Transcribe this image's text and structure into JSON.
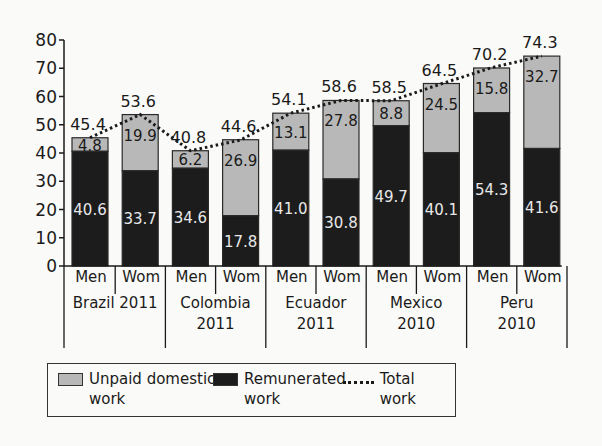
{
  "chart_data": {
    "type": "bar",
    "stacked": true,
    "title": "",
    "xlabel": "",
    "ylabel": "",
    "ylim": [
      0,
      80
    ],
    "yticks": [
      0,
      10,
      20,
      30,
      40,
      50,
      60,
      70,
      80
    ],
    "grid": false,
    "legend_position": "bottom",
    "groups": [
      {
        "label_line1": "Brazil 2011",
        "label_line2": ""
      },
      {
        "label_line1": "Colombia",
        "label_line2": "2011"
      },
      {
        "label_line1": "Ecuador",
        "label_line2": "2011"
      },
      {
        "label_line1": "Mexico",
        "label_line2": "2010"
      },
      {
        "label_line1": "Peru",
        "label_line2": "2010"
      }
    ],
    "categories": [
      "Men",
      "Wom",
      "Men",
      "Wom",
      "Men",
      "Wom",
      "Men",
      "Wom",
      "Men",
      "Wom"
    ],
    "series": [
      {
        "name": "Remunerated work",
        "color": "#1c1c1c",
        "values": [
          40.6,
          33.7,
          34.6,
          17.8,
          41.0,
          30.8,
          49.7,
          40.1,
          54.3,
          41.6
        ]
      },
      {
        "name": "Unpaid domestic work",
        "color": "#b8b8b8",
        "values": [
          4.8,
          19.9,
          6.2,
          26.9,
          13.1,
          27.8,
          8.8,
          24.5,
          15.8,
          32.7
        ]
      },
      {
        "name": "Total work",
        "style": "dotted-line",
        "values": [
          45.4,
          53.6,
          40.8,
          44.6,
          54.1,
          58.6,
          58.5,
          64.5,
          70.2,
          74.3
        ]
      }
    ],
    "value_labels": {
      "remunerated": [
        "40.6",
        "33.7",
        "34.6",
        "17.8",
        "41.0",
        "30.8",
        "49.7",
        "40.1",
        "54.3",
        "41.6"
      ],
      "unpaid": [
        "4.8",
        "19.9",
        "6.2",
        "26.9",
        "13.1",
        "27.8",
        "8.8",
        "24.5",
        "15.8",
        "32.7"
      ],
      "total": [
        "45.4",
        "53.6",
        "40.8",
        "44.6",
        "54.1",
        "58.6",
        "58.5",
        "64.5",
        "70.2",
        "74.3"
      ]
    }
  },
  "legend": {
    "unpaid": "Unpaid domestic\nwork",
    "remunerated": "Remunerated\nwork",
    "total": "Total work"
  },
  "colors": {
    "unpaid": "#b8b8b8",
    "remunerated": "#1c1c1c",
    "axis": "#1a1a1a"
  }
}
